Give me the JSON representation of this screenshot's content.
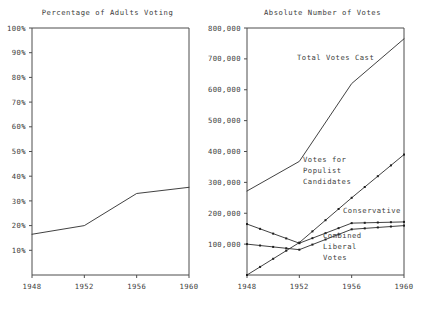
{
  "figure": {
    "width": 430,
    "height": 309,
    "background": "#ffffff",
    "ink_color": "#3d3d3d"
  },
  "panels": {
    "left": {
      "title": "Percentage of Adults Voting"
    },
    "right": {
      "title": "Absolute Number of Votes"
    }
  },
  "chart_data": [
    {
      "type": "line",
      "title": "Percentage of Adults Voting",
      "xlabel": "",
      "ylabel": "",
      "x": [
        1948,
        1952,
        1956,
        1960
      ],
      "xticks": [
        "1948",
        "1952",
        "1956",
        "1960"
      ],
      "xlim": [
        1948,
        1960
      ],
      "ylim": [
        0,
        100
      ],
      "yticks": [
        10,
        20,
        30,
        40,
        50,
        60,
        70,
        80,
        90,
        100
      ],
      "ytick_labels": [
        "10%",
        "20%",
        "30%",
        "40%",
        "50%",
        "60%",
        "70%",
        "80%",
        "90%",
        "100%"
      ],
      "grid": false,
      "legend": "none",
      "series": [
        {
          "name": "Percentage of adults voting",
          "values": [
            16.5,
            20.0,
            33.0,
            35.5
          ],
          "markers": false
        }
      ]
    },
    {
      "type": "line",
      "title": "Absolute Number of Votes",
      "xlabel": "",
      "ylabel": "",
      "x": [
        1948,
        1952,
        1956,
        1960
      ],
      "xticks": [
        "1948",
        "1952",
        "1956",
        "1960"
      ],
      "xlim": [
        1948,
        1960
      ],
      "ylim": [
        0,
        800000
      ],
      "yticks": [
        100000,
        200000,
        300000,
        400000,
        500000,
        600000,
        700000,
        800000
      ],
      "ytick_labels": [
        "100,000",
        "200,000",
        "300,000",
        "400,000",
        "500,000",
        "600,000",
        "700,000",
        "800,000"
      ],
      "grid": false,
      "legend": "inline-annotations",
      "series": [
        {
          "name": "Total Votes Cast",
          "values": [
            272000,
            368000,
            620000,
            765000
          ],
          "markers": false
        },
        {
          "name": "Votes for Populist Candidates",
          "values": [
            0,
            105000,
            250000,
            390000
          ],
          "markers": true
        },
        {
          "name": "Conservative",
          "values": [
            165000,
            103000,
            168000,
            172000
          ],
          "markers": true
        },
        {
          "name": "Combined Liberal Votes",
          "values": [
            100000,
            82000,
            148000,
            160000
          ],
          "markers": true
        }
      ],
      "annotations": [
        {
          "name": "total-votes-cast",
          "lines": [
            "Total Votes Cast"
          ]
        },
        {
          "name": "votes-for-populist-candidates",
          "lines": [
            "Votes for",
            "Populist",
            "Candidates"
          ]
        },
        {
          "name": "conservative",
          "lines": [
            "Conservative"
          ]
        },
        {
          "name": "combined-liberal-votes",
          "lines": [
            "Combined",
            "Liberal",
            "Votes"
          ]
        }
      ]
    }
  ]
}
